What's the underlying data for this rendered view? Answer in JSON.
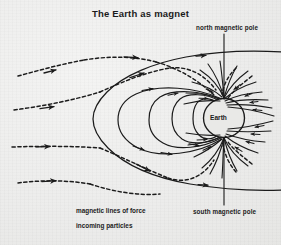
{
  "figure": {
    "title": "The Earth as magnet",
    "background_color": "#efefee",
    "ink_color": "#1b1b1b"
  },
  "labels": {
    "north_pole": "north magnetic pole",
    "south_pole": "south magnetic pole",
    "earth": "Earth"
  },
  "legend": {
    "items": [
      {
        "label": "magnetic lines of force",
        "style": "solid",
        "icon": "solid-line-icon"
      },
      {
        "label": "incoming particles",
        "style": "dashed",
        "icon": "dashed-line-icon"
      }
    ]
  },
  "diagram_data": {
    "type": "schematic",
    "subject": "Earth's magnetosphere",
    "body": {
      "name": "Earth",
      "center_x": 224,
      "center_y": 118,
      "radius": 20
    },
    "poles": [
      {
        "name": "north magnetic pole",
        "x": 224,
        "y": 98,
        "pointer_from_y": 34
      },
      {
        "name": "south magnetic pole",
        "x": 224,
        "y": 138,
        "pointer_to_y": 205
      }
    ],
    "field_loops": [
      {
        "extent_left_x": 196,
        "label": "innermost closed field line"
      },
      {
        "extent_left_x": 178,
        "label": "closed field line"
      },
      {
        "extent_left_x": 152,
        "label": "closed field line"
      },
      {
        "extent_left_x": 118,
        "label": "outermost closed field line"
      }
    ],
    "magnetopause": {
      "nose_x": 92,
      "label": "bow shock / magnetopause boundary"
    },
    "incoming_particle_streams": [
      {
        "y": 68,
        "direction": "rightward"
      },
      {
        "y": 105,
        "direction": "rightward"
      },
      {
        "y": 145,
        "direction": "rightward"
      },
      {
        "y": 180,
        "direction": "rightward"
      }
    ],
    "polar_field_line_count": 13,
    "flow_direction": "field lines converge inward at both magnetic poles"
  }
}
